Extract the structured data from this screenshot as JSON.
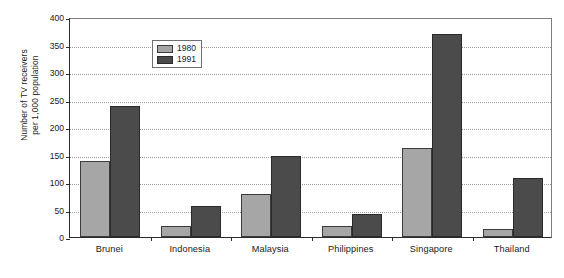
{
  "chart_data": {
    "type": "bar",
    "title": "",
    "xlabel": "",
    "ylabel": "Number of TV receivers per 1,000 population",
    "ylabel_line1": "Number of TV receivers",
    "ylabel_line2": "per 1,000 population",
    "ylim": [
      0,
      400
    ],
    "ytick_step": 50,
    "ytick_labels": [
      "400",
      "350",
      "300",
      "250",
      "200",
      "150",
      "100",
      "50",
      "0"
    ],
    "ytick_values": [
      400,
      350,
      300,
      250,
      200,
      150,
      100,
      50,
      0
    ],
    "grid": "horizontal-dotted",
    "legend_position": "top-left-inside",
    "categories": [
      "Brunei",
      "Indonesia",
      "Malaysia",
      "Philippines",
      "Singapore",
      "Thailand"
    ],
    "series": [
      {
        "name": "1980",
        "color": "#a6a6a6",
        "values": [
          139,
          20,
          78,
          20,
          162,
          15
        ]
      },
      {
        "name": "1991",
        "color": "#4b4b4b",
        "values": [
          239,
          57,
          148,
          42,
          370,
          107
        ]
      }
    ]
  },
  "legend": {
    "items": [
      {
        "label": "1980",
        "color": "#a6a6a6"
      },
      {
        "label": "1991",
        "color": "#4b4b4b"
      }
    ]
  }
}
